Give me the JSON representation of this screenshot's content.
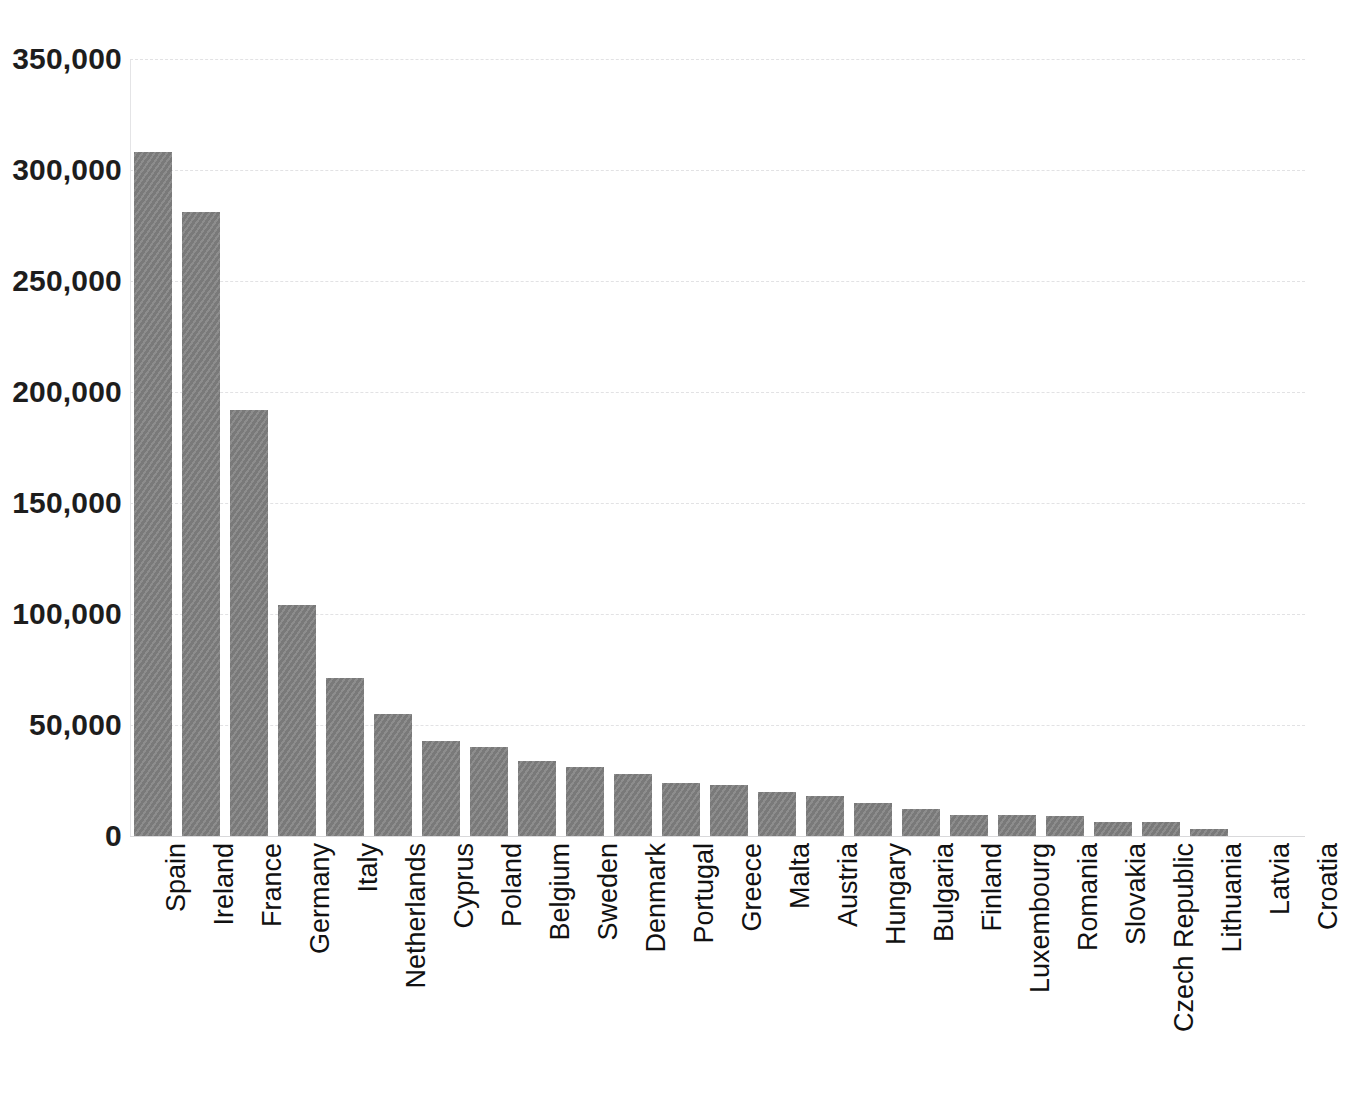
{
  "chart_data": {
    "type": "bar",
    "title": "",
    "subtitle": "",
    "xlabel": "",
    "ylabel": "",
    "ylim": [
      0,
      350000
    ],
    "ytick_labels": [
      "0",
      "50,000",
      "100,000",
      "150,000",
      "200,000",
      "250,000",
      "300,000",
      "350,000"
    ],
    "yticks": [
      0,
      50000,
      100000,
      150000,
      200000,
      250000,
      300000,
      350000
    ],
    "grid": true,
    "legend": null,
    "legend_position": "none",
    "bar_color": "#808080",
    "gridline_color": "#e2e2e4",
    "axis_color": "#e4e4e6",
    "categories": [
      "Spain",
      "Ireland",
      "France",
      "Germany",
      "Italy",
      "Netherlands",
      "Cyprus",
      "Poland",
      "Belgium",
      "Sweden",
      "Denmark",
      "Portugal",
      "Greece",
      "Malta",
      "Austria",
      "Hungary",
      "Bulgaria",
      "Finland",
      "Luxembourg",
      "Romania",
      "Slovakia",
      "Czech Republic",
      "Lithuania",
      "Latvia",
      "Croatia",
      "Estonia",
      "Slovenia"
    ],
    "values": [
      308000,
      281000,
      192000,
      104000,
      71000,
      55000,
      43000,
      40000,
      34000,
      31000,
      28000,
      24000,
      23000,
      20000,
      18000,
      15000,
      12000,
      9500,
      9300,
      9000,
      6500,
      6300,
      3000,
      0,
      0,
      0,
      0
    ]
  }
}
